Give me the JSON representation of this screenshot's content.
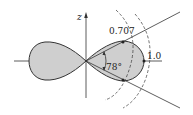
{
  "diagram": {
    "type": "polar radiation pattern (figure-eight lobes)",
    "axis_labels": {
      "vertical": "z"
    },
    "labels": {
      "half_power": "0.707",
      "max": "1.0",
      "angle": "78°"
    },
    "colors": {
      "lobe_fill": "#cfcfcf",
      "stroke": "#333333",
      "background": "#ffffff"
    }
  }
}
